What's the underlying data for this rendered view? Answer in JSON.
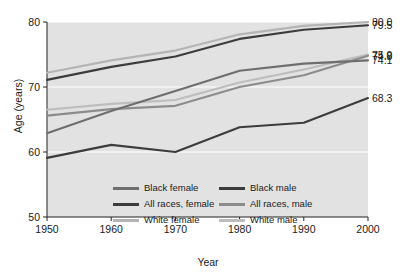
{
  "chart_data": {
    "type": "line",
    "title": "",
    "xlabel": "Year",
    "ylabel": "Age (years)",
    "x": [
      1950,
      1960,
      1970,
      1980,
      1990,
      2000
    ],
    "xlim": [
      1950,
      2000
    ],
    "ylim": [
      50,
      80
    ],
    "xticks": [
      "1950",
      "1960",
      "1970",
      "1980",
      "1990",
      "2000"
    ],
    "yticks": [
      "50",
      "60",
      "70",
      "80"
    ],
    "grid": "horizontal-white",
    "legend_position": "inside-bottom-center",
    "plot_background": "#e2e2e2",
    "series": [
      {
        "name": "White female",
        "color": "#b4b4b4",
        "values": [
          72.2,
          74.1,
          75.6,
          78.1,
          79.4,
          80.0
        ],
        "end_label": "80.0"
      },
      {
        "name": "All races, female",
        "color": "#3c3c3c",
        "values": [
          71.1,
          73.1,
          74.7,
          77.4,
          78.8,
          79.5
        ],
        "end_label": "79.5"
      },
      {
        "name": "White male",
        "color": "#bdbdbd",
        "values": [
          66.5,
          67.4,
          68.0,
          70.7,
          72.7,
          75.0
        ],
        "end_label": "75.0"
      },
      {
        "name": "All races, male",
        "color": "#8c8c8c",
        "values": [
          65.6,
          66.6,
          67.1,
          70.0,
          71.8,
          74.8
        ],
        "end_label": "74.8"
      },
      {
        "name": "Black female",
        "color": "#6e6e6e",
        "values": [
          62.9,
          66.3,
          69.4,
          72.5,
          73.6,
          74.1
        ],
        "end_label": "74.1"
      },
      {
        "name": "Black male",
        "color": "#3c3c3c",
        "values": [
          59.1,
          61.1,
          60.0,
          63.8,
          64.5,
          68.3
        ],
        "end_label": "68.3"
      }
    ],
    "end_labels": [
      "80.0",
      "79.5",
      "75.0",
      "74.8",
      "74.1",
      "68.3"
    ],
    "legend": [
      {
        "label": "Black female",
        "color": "#6e6e6e"
      },
      {
        "label": "Black male",
        "color": "#3c3c3c"
      },
      {
        "label": "All races, female",
        "color": "#3c3c3c"
      },
      {
        "label": "All races, male",
        "color": "#8c8c8c"
      },
      {
        "label": "White female",
        "color": "#b4b4b4"
      },
      {
        "label": "White male",
        "color": "#bdbdbd"
      }
    ]
  }
}
